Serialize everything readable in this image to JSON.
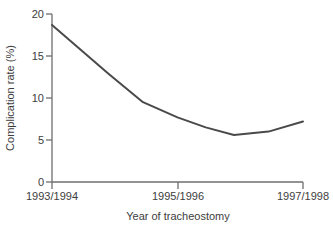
{
  "chart_data": {
    "type": "line",
    "title": "",
    "subtitle": "",
    "xlabel": "Year of tracheostomy",
    "ylabel": "Complication rate (%)",
    "xtick_labels": [
      "1993/1994",
      "1995/1996",
      "1997/1998"
    ],
    "xtick_positions": [
      0,
      2,
      4
    ],
    "ytick_labels": [
      "0",
      "5",
      "10",
      "15",
      "20"
    ],
    "ytick_values": [
      0,
      5,
      10,
      15,
      20
    ],
    "ylim": [
      0,
      20
    ],
    "xlim": [
      0,
      4
    ],
    "grid": false,
    "legend": null,
    "series": [
      {
        "name": "Complication rate",
        "color": "#4a4a4a",
        "x": [
          0,
          0.9,
          1.45,
          2.0,
          2.45,
          2.9,
          3.45,
          4.0
        ],
        "values": [
          18.7,
          12.9,
          9.5,
          7.7,
          6.5,
          5.6,
          6.0,
          7.2
        ]
      }
    ],
    "annotations": []
  },
  "axes": {
    "axis_color": "#6e6e6e",
    "line_color": "#4a4a4a",
    "background": "#ffffff"
  }
}
